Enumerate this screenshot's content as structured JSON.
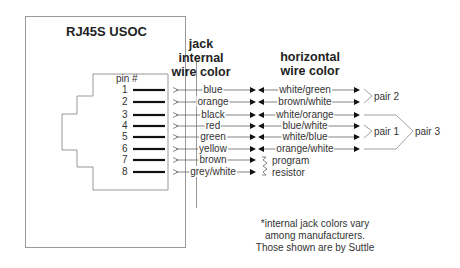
{
  "diagram": {
    "title": "RJ45S USOC",
    "headers": {
      "jack_line1": "jack",
      "jack_line2": "internal",
      "jack_line3": "wire color",
      "horiz_line1": "horizontal",
      "horiz_line2": "wire color"
    },
    "pin_header": "pin #",
    "pins": [
      {
        "pin": "1",
        "jack_color": "blue",
        "horizontal_color": "white/green"
      },
      {
        "pin": "2",
        "jack_color": "orange",
        "horizontal_color": "brown/white"
      },
      {
        "pin": "3",
        "jack_color": "black",
        "horizontal_color": "white/orange"
      },
      {
        "pin": "4",
        "jack_color": "red",
        "horizontal_color": "blue/white"
      },
      {
        "pin": "5",
        "jack_color": "green",
        "horizontal_color": "white/blue"
      },
      {
        "pin": "6",
        "jack_color": "yellow",
        "horizontal_color": "orange/white"
      },
      {
        "pin": "7",
        "jack_color": "brown",
        "horizontal_color": ""
      },
      {
        "pin": "8",
        "jack_color": "grey/white",
        "horizontal_color": ""
      }
    ],
    "resistor_label_line1": "program",
    "resistor_label_line2": "resistor",
    "pairs": {
      "pair2": "pair 2",
      "pair1": "pair 1",
      "pair3": "pair 3"
    },
    "note": {
      "line1": "*internal jack colors vary",
      "line2": "among manufacturers.",
      "line3": "Those shown are by Suttle"
    }
  }
}
